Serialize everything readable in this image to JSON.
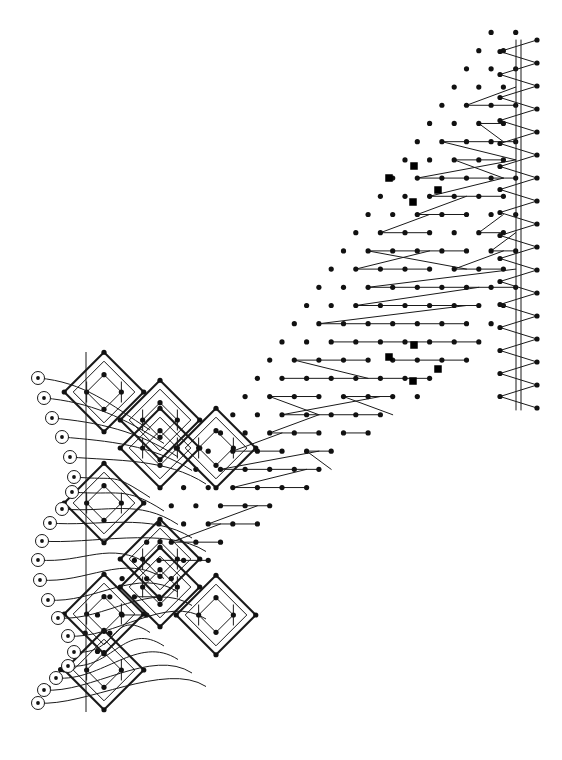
{
  "figure": {
    "background_color": "#ffffff",
    "ink_color": "#000000",
    "width": 562,
    "height": 760
  },
  "style": {
    "dot_color": "#111111",
    "dot_radius": 2.6,
    "square_marker_color": "#000000",
    "square_marker_size": 7.5,
    "terminal_ring_color": "#000000",
    "terminal_ring_radius": 6.5,
    "terminal_core_radius": 1.9,
    "line_color": "#1a1a1a",
    "thin_line_width": 1.0,
    "thick_line_width": 2.1,
    "rail_line_width": 0.9
  },
  "lattice": {
    "description": "Triangular/hex dot lattice filling a wedge",
    "origin_x": 44,
    "origin_y": 706,
    "dx": 24.6,
    "dy": 24.6,
    "rows": 28,
    "cols": 20,
    "row_offset_fraction": 0.5,
    "wedge_apex_x": 36,
    "wedge_apex_y": 706,
    "wedge_top_slope": -1.52,
    "wedge_right_x": 516
  },
  "zigzag_field": {
    "description": "Sawtooth chains: long shallow run then short return",
    "count": 96,
    "min_run": 28,
    "max_run": 205
  },
  "diamond_cells": {
    "description": "Nested rhombic cells along the left margin",
    "cells": [
      {
        "cx": 104,
        "cy": 392,
        "w": 56,
        "h": 56,
        "inner": true
      },
      {
        "cx": 104,
        "cy": 503,
        "w": 56,
        "h": 56,
        "inner": true
      },
      {
        "cx": 104,
        "cy": 614,
        "w": 56,
        "h": 56,
        "inner": true
      },
      {
        "cx": 104,
        "cy": 670,
        "w": 56,
        "h": 56,
        "inner": true
      },
      {
        "cx": 160,
        "cy": 420,
        "w": 56,
        "h": 56,
        "inner": true
      },
      {
        "cx": 160,
        "cy": 448,
        "w": 56,
        "h": 56,
        "inner": true
      },
      {
        "cx": 160,
        "cy": 559,
        "w": 56,
        "h": 56,
        "inner": true
      },
      {
        "cx": 160,
        "cy": 587,
        "w": 56,
        "h": 56,
        "inner": true
      },
      {
        "cx": 216,
        "cy": 448,
        "w": 56,
        "h": 56,
        "inner": true
      },
      {
        "cx": 216,
        "cy": 615,
        "w": 56,
        "h": 56,
        "inner": true
      }
    ]
  },
  "terminals": {
    "description": "Ringed terminal nodes on the scalloped left boundary",
    "count": 20,
    "nodes": [
      {
        "x": 38,
        "y": 378
      },
      {
        "x": 44,
        "y": 398
      },
      {
        "x": 52,
        "y": 418
      },
      {
        "x": 62,
        "y": 437
      },
      {
        "x": 70,
        "y": 457
      },
      {
        "x": 74,
        "y": 477
      },
      {
        "x": 72,
        "y": 492
      },
      {
        "x": 62,
        "y": 509
      },
      {
        "x": 50,
        "y": 523
      },
      {
        "x": 42,
        "y": 541
      },
      {
        "x": 38,
        "y": 560
      },
      {
        "x": 40,
        "y": 580
      },
      {
        "x": 48,
        "y": 600
      },
      {
        "x": 58,
        "y": 618
      },
      {
        "x": 68,
        "y": 636
      },
      {
        "x": 74,
        "y": 652
      },
      {
        "x": 68,
        "y": 666
      },
      {
        "x": 56,
        "y": 678
      },
      {
        "x": 44,
        "y": 690
      },
      {
        "x": 38,
        "y": 703
      }
    ]
  },
  "square_markers": {
    "description": "Emphasised lattice sites shown as filled squares",
    "points": [
      {
        "x": 389,
        "y": 178
      },
      {
        "x": 414,
        "y": 166
      },
      {
        "x": 438,
        "y": 190
      },
      {
        "x": 413,
        "y": 202
      },
      {
        "x": 389,
        "y": 357
      },
      {
        "x": 414,
        "y": 345
      },
      {
        "x": 438,
        "y": 369
      },
      {
        "x": 413,
        "y": 381
      }
    ]
  },
  "right_rail": {
    "description": "Vertical double rail with weaving zigzag",
    "x1": 516,
    "x2": 521,
    "y_top": 40,
    "y_bottom": 410,
    "zig_amplitude": 16,
    "zig_period": 23
  }
}
